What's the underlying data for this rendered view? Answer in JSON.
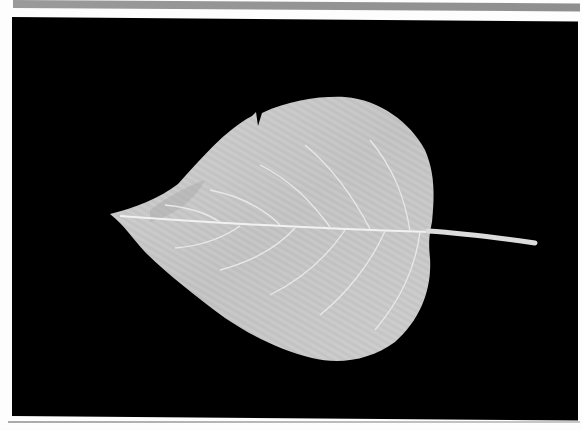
{
  "image": {
    "subject": "leaf",
    "description": "Pale gray broad heart-shaped leaf with visible midrib, lateral veins and long petiole, photographed on a black background",
    "colors": {
      "background": "#000000",
      "leaf": "#c9c9c9",
      "veins": "#eeeeee",
      "border": "#fdfdfd",
      "top_bar": "#949494"
    }
  }
}
